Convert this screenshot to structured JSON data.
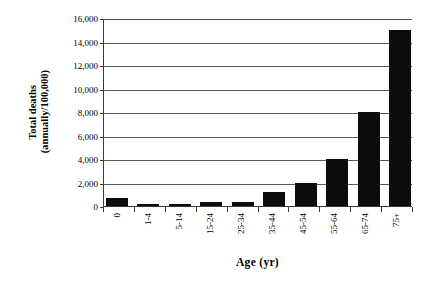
{
  "chart_data": {
    "type": "bar",
    "title": "",
    "xlabel": "Age (yr)",
    "ylabel": "Total deaths (annually/100,000)",
    "ylabel_line1": "Total deaths",
    "ylabel_line2": "(annually/100,000)",
    "categories": [
      "0",
      "1-4",
      "5-14",
      "15-24",
      "25-34",
      "35-44",
      "45-54",
      "55-64",
      "65-74",
      "75+"
    ],
    "values": [
      650,
      200,
      150,
      300,
      300,
      1200,
      2000,
      4000,
      8000,
      15000
    ],
    "ylim": [
      0,
      16000
    ],
    "ytick_values": [
      0,
      2000,
      4000,
      6000,
      8000,
      10000,
      12000,
      14000,
      16000
    ],
    "ytick_labels": [
      "0",
      "2,000",
      "4,000",
      "6,000",
      "8,000",
      "10,000",
      "12,000",
      "14,000",
      "16,000"
    ],
    "grid": true,
    "legend": null,
    "bar_color": "#0d0d0d",
    "axis_color": "#3a3a3a",
    "grid_color": "#5a5a5a",
    "background_color": "#ffffff"
  }
}
